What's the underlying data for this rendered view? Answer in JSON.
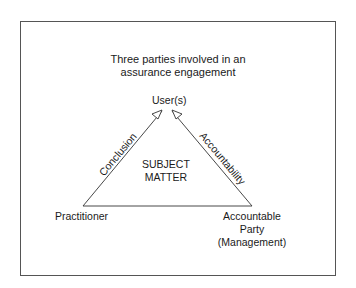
{
  "diagram": {
    "title_lines": [
      "Three parties involved in an",
      "assurance engagement"
    ],
    "nodes": {
      "top": "User(s)",
      "left": "Practitioner",
      "right_lines": [
        "Accountable",
        "Party",
        "(Management)"
      ],
      "center_lines": [
        "SUBJECT",
        "MATTER"
      ]
    },
    "edges": {
      "left": "Conclusion",
      "right": "Accountability"
    },
    "colors": {
      "line": "#333333",
      "border": "#555555",
      "text": "#1a1a1a"
    }
  }
}
